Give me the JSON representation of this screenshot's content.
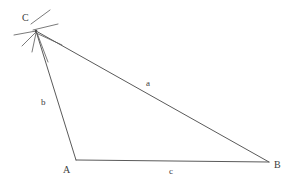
{
  "figure": {
    "width": 290,
    "height": 182,
    "background_color": "#ffffff",
    "stroke_color": "#5a5a5a",
    "construction_stroke_color": "#6b6b6b",
    "label_color": "#3c3c3c"
  },
  "vertices": [
    {
      "id": "C",
      "label": "C",
      "x": 36,
      "y": 31,
      "label_x": 22,
      "label_y": 13
    },
    {
      "id": "A",
      "label": "A",
      "x": 76,
      "y": 160,
      "label_x": 63,
      "label_y": 165
    },
    {
      "id": "B",
      "label": "B",
      "x": 269,
      "y": 162,
      "label_x": 274,
      "label_y": 160
    }
  ],
  "sides": [
    {
      "id": "a",
      "label": "a",
      "from": "C",
      "to": "B",
      "label_x": 146,
      "label_y": 79
    },
    {
      "id": "b",
      "label": "b",
      "from": "C",
      "to": "A",
      "label_x": 41,
      "label_y": 98
    },
    {
      "id": "c",
      "label": "c",
      "from": "A",
      "to": "B",
      "label_x": 169,
      "label_y": 167
    }
  ],
  "construction_marks": {
    "center_x": 36,
    "center_y": 31,
    "description": "crossing compass arc strokes through vertex C"
  }
}
